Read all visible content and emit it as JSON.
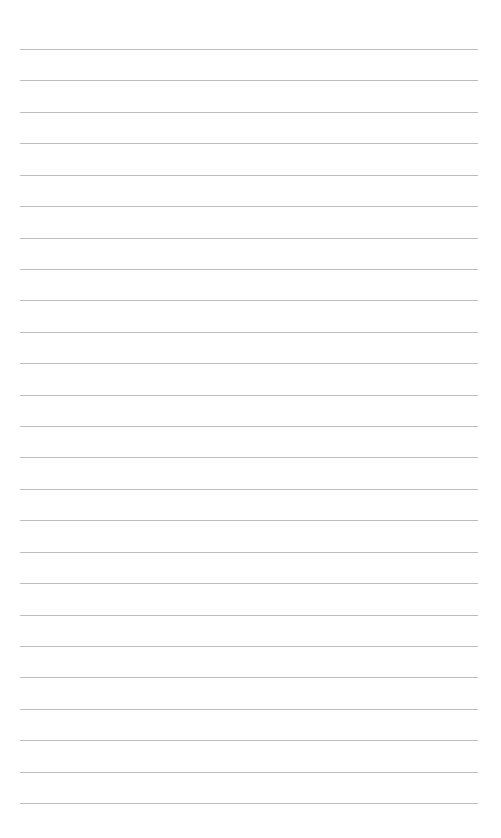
{
  "page": {
    "type": "lined-paper",
    "background_color": "#ffffff",
    "line_color": "#bdbdbd",
    "line_count": 25,
    "first_line_y": 49,
    "line_spacing": 31.42,
    "line_left": 20,
    "line_right": 478
  }
}
